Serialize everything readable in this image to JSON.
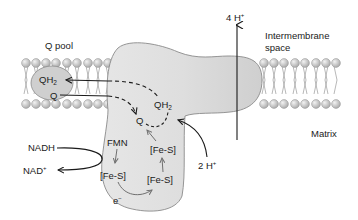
{
  "diagram": {
    "regions": {
      "q_pool": "Q pool",
      "intermembrane_space_line1": "Intermembrane",
      "intermembrane_space_line2": "space",
      "matrix": "Matrix"
    },
    "molecules": {
      "qh2_pool": "QH",
      "qh2_pool_sub": "2",
      "q_pool": "Q",
      "qh2_site": "QH",
      "qh2_site_sub": "2",
      "q_site": "Q",
      "nadh": "NADH",
      "nad_plus": "NAD",
      "nad_plus_sup": "+",
      "fmn": "FMN",
      "fes_1": "[Fe-S]",
      "fes_2": "[Fe-S]",
      "fes_3": "[Fe-S]",
      "electron": "e",
      "electron_sup": "−"
    },
    "protons": {
      "pumped": "4 H",
      "pumped_sup": "+",
      "taken_up": "2 H",
      "taken_up_sup": "+"
    },
    "colors": {
      "complex_fill": "#dcdcdc",
      "complex_stroke": "#8a8a8a",
      "lipid_head": "#bdbdbd",
      "lipid_tail": "#9a9a9a",
      "q_pool_fill": "#cfcfcf",
      "arrow": "#1a1a1a",
      "inner_arrow": "#6f6f6f"
    }
  }
}
